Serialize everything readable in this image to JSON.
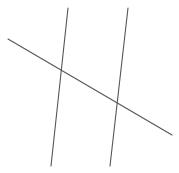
{
  "diagram": {
    "type": "geometry",
    "stroke_color": "#555555",
    "background": "#ffffff",
    "lines": [
      {
        "id": "left-line",
        "x1": 68,
        "y1": 8,
        "x2": 51,
        "y2": 166
      },
      {
        "id": "right-line",
        "x1": 128,
        "y1": 8,
        "x2": 110,
        "y2": 166
      },
      {
        "id": "transversal",
        "x1": 8,
        "y1": 39,
        "x2": 172,
        "y2": 135
      }
    ],
    "intersections": [
      {
        "x": 61,
        "y": 70
      },
      {
        "x": 117,
        "y": 103
      }
    ]
  }
}
